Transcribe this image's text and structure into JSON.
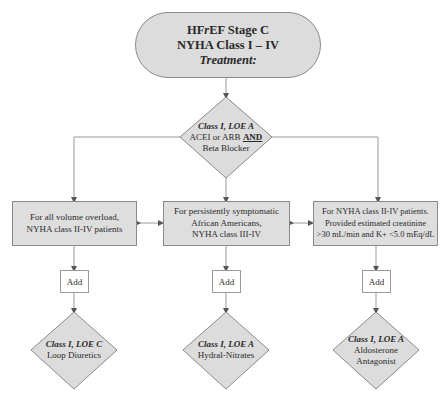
{
  "top": {
    "line1": "HFrEF Stage C",
    "line1_prefix": "HF",
    "line1_italic": "r",
    "line1_suffix": "EF Stage C",
    "line2": "NYHA Class I – IV",
    "line3": "Treatment:"
  },
  "decision": {
    "class_loe": "Class I, LOE A",
    "line2_prefix": "ACEI or ARB ",
    "line2_and": "AND",
    "line3": "Beta Blocker"
  },
  "branches": [
    {
      "condition_lines": [
        "For all volume overload,",
        "NYHA class II-IV patients"
      ],
      "add_label": "Add",
      "outcome_class": "Class I, LOE C",
      "outcome_lines": [
        "Loop Diuretics"
      ]
    },
    {
      "condition_lines": [
        "For persistently symptomatic",
        "African Americans,",
        "NYHA class III-IV"
      ],
      "add_label": "Add",
      "outcome_class": "Class I, LOE A",
      "outcome_lines": [
        "Hydral-Nitrates"
      ]
    },
    {
      "condition_lines": [
        "For NYHA class II-IV patients.",
        "Provided  estimated creatinine",
        ">30 mL/min and K+ <5.0 mEq/dL"
      ],
      "add_label": "Add",
      "outcome_class": "Class I, LOE A",
      "outcome_lines": [
        "Aldosterone",
        "Antagonist"
      ]
    }
  ],
  "colors": {
    "fill": "#dcdcdc",
    "stroke": "#8a8a8a",
    "line": "#9a9a9a",
    "text": "#2a2a2a"
  }
}
